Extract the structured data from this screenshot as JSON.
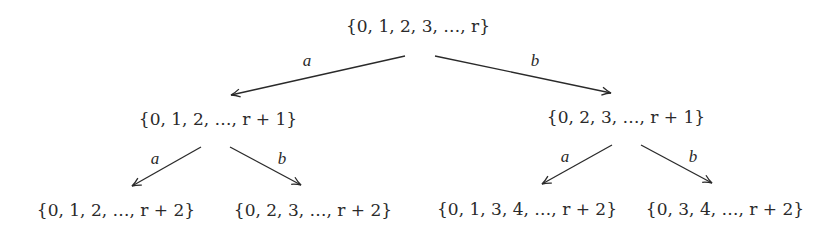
{
  "diagram": {
    "type": "binary-tree",
    "nodes": {
      "root": "{0, 1, 2, 3, …, r}",
      "left": "{0, 1, 2, …, r + 1}",
      "right": "{0, 2, 3, …, r + 1}",
      "left_left": "{0, 1, 2, …, r + 2}",
      "left_right": "{0, 2, 3, …, r + 2}",
      "right_left": "{0, 1, 3, 4, …, r + 2}",
      "right_right": "{0, 3, 4, …, r + 2}"
    },
    "edges": [
      {
        "from": "root",
        "to": "left",
        "label": "a"
      },
      {
        "from": "root",
        "to": "right",
        "label": "b"
      },
      {
        "from": "left",
        "to": "left_left",
        "label": "a"
      },
      {
        "from": "left",
        "to": "left_right",
        "label": "b"
      },
      {
        "from": "right",
        "to": "right_left",
        "label": "a"
      },
      {
        "from": "right",
        "to": "right_right",
        "label": "b"
      }
    ],
    "colors": {
      "ink": "#2a2a2a",
      "background": "#ffffff"
    }
  }
}
